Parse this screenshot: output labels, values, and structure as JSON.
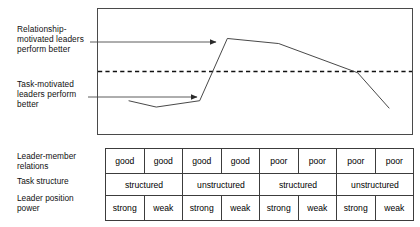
{
  "annotations": {
    "relationship": "Relationship-\nmotivated leaders\nperform better",
    "task": "Task-motivated\nleaders perform\nbetter"
  },
  "row_labels": {
    "leader_member": "Leader-member\nrelations",
    "task_structure": "Task structure",
    "leader_position": "Leader position\npower"
  },
  "table": {
    "rows": [
      {
        "name": "leader-member-relations",
        "cells": [
          {
            "text": "good",
            "span": 1
          },
          {
            "text": "good",
            "span": 1
          },
          {
            "text": "good",
            "span": 1
          },
          {
            "text": "good",
            "span": 1
          },
          {
            "text": "poor",
            "span": 1
          },
          {
            "text": "poor",
            "span": 1
          },
          {
            "text": "poor",
            "span": 1
          },
          {
            "text": "poor",
            "span": 1
          }
        ]
      },
      {
        "name": "task-structure",
        "cells": [
          {
            "text": "structured",
            "span": 2
          },
          {
            "text": "unstructured",
            "span": 2
          },
          {
            "text": "structured",
            "span": 2
          },
          {
            "text": "unstructured",
            "span": 2
          }
        ]
      },
      {
        "name": "leader-position-power",
        "cells": [
          {
            "text": "strong",
            "span": 1
          },
          {
            "text": "weak",
            "span": 1
          },
          {
            "text": "strong",
            "span": 1
          },
          {
            "text": "weak",
            "span": 1
          },
          {
            "text": "strong",
            "span": 1
          },
          {
            "text": "weak",
            "span": 1
          },
          {
            "text": "strong",
            "span": 1
          },
          {
            "text": "weak",
            "span": 1
          }
        ]
      }
    ]
  },
  "chart_data": {
    "type": "line",
    "title": "",
    "xlabel": "",
    "ylabel": "",
    "grid": false,
    "legend": "none",
    "axis_box": {
      "x": 97,
      "y": 8,
      "width": 316,
      "height": 127
    },
    "xlim": [
      0,
      8
    ],
    "ylim": [
      0,
      100
    ],
    "series": [
      {
        "name": "Leader performance",
        "color": "#333333",
        "style": "solid",
        "points": [
          {
            "x": 0.8,
            "y": 27
          },
          {
            "x": 1.5,
            "y": 22
          },
          {
            "x": 2.6,
            "y": 27
          },
          {
            "x": 3.3,
            "y": 76
          },
          {
            "x": 4.6,
            "y": 72
          },
          {
            "x": 6.6,
            "y": 49
          },
          {
            "x": 7.4,
            "y": 21
          }
        ]
      }
    ],
    "reference_line": {
      "name": "midpoint-threshold",
      "style": "dashed",
      "color": "#111111",
      "y": 50
    },
    "callouts": [
      {
        "name": "relationship-arrow",
        "label": "Relationship-motivated leaders perform better",
        "from": {
          "x": 90,
          "y": 42
        },
        "to": {
          "x": 216,
          "y": 42
        }
      },
      {
        "name": "task-arrow",
        "label": "Task-motivated leaders perform better",
        "from": {
          "x": 88,
          "y": 97
        },
        "to": {
          "x": 197,
          "y": 97
        }
      }
    ]
  }
}
